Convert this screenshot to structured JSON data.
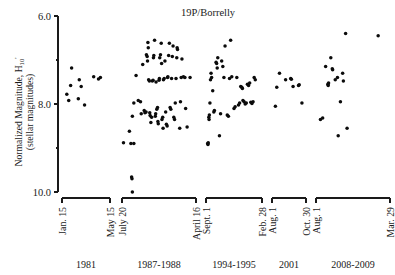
{
  "chart_data": {
    "type": "scatter",
    "title": "19P/Borrelly",
    "xlabel": "",
    "ylabel": "Normalized Magnitude, H10' (stellar magnitudes)",
    "ylabel_parts": {
      "line1_pre": "Normalized Magnitude, H",
      "line1_sub": "10",
      "line1_sup": "'",
      "line2": "(stellar magnitudes)"
    },
    "y_axis": {
      "inverted": true,
      "min": 6.0,
      "max": 10.0,
      "major_ticks": [
        6.0,
        8.0,
        10.0
      ],
      "major_tick_labels": [
        "6.0",
        "8.0",
        "10.0"
      ],
      "minor_ticks": [
        7.0,
        9.0
      ],
      "grid": false
    },
    "legend": "none",
    "groups": [
      {
        "name": "1981",
        "start_label": "Jan. 15",
        "end_label": "May 15",
        "points": [
          {
            "t": 0.1,
            "m": 7.78
          },
          {
            "t": 0.2,
            "m": 7.18
          },
          {
            "t": 0.18,
            "m": 7.58
          },
          {
            "t": 0.14,
            "m": 7.92
          },
          {
            "t": 0.36,
            "m": 7.45
          },
          {
            "t": 0.4,
            "m": 7.6
          },
          {
            "t": 0.34,
            "m": 7.88
          },
          {
            "t": 0.47,
            "m": 8.02
          },
          {
            "t": 0.66,
            "m": 7.38
          },
          {
            "t": 0.76,
            "m": 7.43
          },
          {
            "t": 0.8,
            "m": 7.4
          }
        ]
      },
      {
        "name": "1987-1988",
        "start_label": "July 20",
        "end_label": "April 16",
        "points": [
          {
            "t": 0.02,
            "m": 8.88
          },
          {
            "t": 0.1,
            "m": 8.62
          },
          {
            "t": 0.12,
            "m": 8.9
          },
          {
            "t": 0.16,
            "m": 8.9
          },
          {
            "t": 0.13,
            "m": 9.66
          },
          {
            "t": 0.135,
            "m": 9.7
          },
          {
            "t": 0.14,
            "m": 10.0
          },
          {
            "t": 0.14,
            "m": 8.28
          },
          {
            "t": 0.16,
            "m": 7.98
          },
          {
            "t": 0.19,
            "m": 7.35
          },
          {
            "t": 0.22,
            "m": 7.92
          },
          {
            "t": 0.25,
            "m": 7.95
          },
          {
            "t": 0.26,
            "m": 8.22
          },
          {
            "t": 0.28,
            "m": 7.1
          },
          {
            "t": 0.3,
            "m": 8.15
          },
          {
            "t": 0.31,
            "m": 8.2
          },
          {
            "t": 0.325,
            "m": 8.18
          },
          {
            "t": 0.33,
            "m": 6.88
          },
          {
            "t": 0.34,
            "m": 6.92
          },
          {
            "t": 0.345,
            "m": 7.02
          },
          {
            "t": 0.35,
            "m": 6.6
          },
          {
            "t": 0.355,
            "m": 6.72
          },
          {
            "t": 0.36,
            "m": 7.45
          },
          {
            "t": 0.37,
            "m": 7.48
          },
          {
            "t": 0.375,
            "m": 8.2
          },
          {
            "t": 0.38,
            "m": 8.26
          },
          {
            "t": 0.39,
            "m": 8.42
          },
          {
            "t": 0.4,
            "m": 8.3
          },
          {
            "t": 0.41,
            "m": 7.48
          },
          {
            "t": 0.42,
            "m": 7.46
          },
          {
            "t": 0.425,
            "m": 6.95
          },
          {
            "t": 0.43,
            "m": 6.9
          },
          {
            "t": 0.44,
            "m": 6.55
          },
          {
            "t": 0.45,
            "m": 8.28
          },
          {
            "t": 0.455,
            "m": 8.22
          },
          {
            "t": 0.46,
            "m": 7.5
          },
          {
            "t": 0.47,
            "m": 8.12
          },
          {
            "t": 0.48,
            "m": 8.08
          },
          {
            "t": 0.485,
            "m": 8.4
          },
          {
            "t": 0.49,
            "m": 8.45
          },
          {
            "t": 0.5,
            "m": 7.46
          },
          {
            "t": 0.505,
            "m": 7.42
          },
          {
            "t": 0.51,
            "m": 6.95
          },
          {
            "t": 0.52,
            "m": 6.88
          },
          {
            "t": 0.53,
            "m": 6.62
          },
          {
            "t": 0.535,
            "m": 7.08
          },
          {
            "t": 0.54,
            "m": 8.35
          },
          {
            "t": 0.55,
            "m": 8.3
          },
          {
            "t": 0.555,
            "m": 8.55
          },
          {
            "t": 0.56,
            "m": 7.45
          },
          {
            "t": 0.57,
            "m": 7.42
          },
          {
            "t": 0.58,
            "m": 7.02
          },
          {
            "t": 0.59,
            "m": 8.18
          },
          {
            "t": 0.6,
            "m": 8.46
          },
          {
            "t": 0.61,
            "m": 8.5
          },
          {
            "t": 0.615,
            "m": 7.4
          },
          {
            "t": 0.62,
            "m": 7.38
          },
          {
            "t": 0.63,
            "m": 6.9
          },
          {
            "t": 0.64,
            "m": 6.62
          },
          {
            "t": 0.65,
            "m": 8.08
          },
          {
            "t": 0.66,
            "m": 8.12
          },
          {
            "t": 0.67,
            "m": 7.42
          },
          {
            "t": 0.68,
            "m": 6.92
          },
          {
            "t": 0.69,
            "m": 6.68
          },
          {
            "t": 0.7,
            "m": 8.3
          },
          {
            "t": 0.71,
            "m": 8.35
          },
          {
            "t": 0.72,
            "m": 7.98
          },
          {
            "t": 0.73,
            "m": 7.42
          },
          {
            "t": 0.74,
            "m": 6.95
          },
          {
            "t": 0.745,
            "m": 6.72
          },
          {
            "t": 0.75,
            "m": 6.76
          },
          {
            "t": 0.78,
            "m": 8.55
          },
          {
            "t": 0.79,
            "m": 7.95
          },
          {
            "t": 0.8,
            "m": 7.4
          },
          {
            "t": 0.81,
            "m": 6.98
          },
          {
            "t": 0.83,
            "m": 7.38
          },
          {
            "t": 0.85,
            "m": 7.4
          },
          {
            "t": 0.86,
            "m": 8.1
          },
          {
            "t": 0.88,
            "m": 8.52
          },
          {
            "t": 0.92,
            "m": 7.4
          }
        ]
      },
      {
        "name": "1994-1995",
        "start_label": "Sept. 1",
        "end_label": "Feb. 28",
        "points": [
          {
            "t": 0.03,
            "m": 8.9
          },
          {
            "t": 0.035,
            "m": 8.92
          },
          {
            "t": 0.04,
            "m": 8.88
          },
          {
            "t": 0.05,
            "m": 8.3
          },
          {
            "t": 0.055,
            "m": 8.35
          },
          {
            "t": 0.06,
            "m": 8.25
          },
          {
            "t": 0.07,
            "m": 7.98
          },
          {
            "t": 0.08,
            "m": 7.45
          },
          {
            "t": 0.09,
            "m": 7.3
          },
          {
            "t": 0.1,
            "m": 7.4
          },
          {
            "t": 0.12,
            "m": 7.7
          },
          {
            "t": 0.14,
            "m": 8.18
          },
          {
            "t": 0.15,
            "m": 8.15
          },
          {
            "t": 0.18,
            "m": 7.05
          },
          {
            "t": 0.19,
            "m": 7.08
          },
          {
            "t": 0.2,
            "m": 7.18
          },
          {
            "t": 0.21,
            "m": 6.95
          },
          {
            "t": 0.24,
            "m": 8.72
          },
          {
            "t": 0.26,
            "m": 8.22
          },
          {
            "t": 0.28,
            "m": 7.02
          },
          {
            "t": 0.3,
            "m": 7.15
          },
          {
            "t": 0.32,
            "m": 7.4
          },
          {
            "t": 0.34,
            "m": 6.68
          },
          {
            "t": 0.38,
            "m": 8.25
          },
          {
            "t": 0.4,
            "m": 8.28
          },
          {
            "t": 0.42,
            "m": 7.42
          },
          {
            "t": 0.44,
            "m": 6.55
          },
          {
            "t": 0.46,
            "m": 7.38
          },
          {
            "t": 0.5,
            "m": 8.1
          },
          {
            "t": 0.52,
            "m": 8.06
          },
          {
            "t": 0.55,
            "m": 7.4
          },
          {
            "t": 0.58,
            "m": 8.02
          },
          {
            "t": 0.6,
            "m": 7.98
          },
          {
            "t": 0.62,
            "m": 7.6
          },
          {
            "t": 0.64,
            "m": 7.62
          },
          {
            "t": 0.65,
            "m": 7.65
          },
          {
            "t": 0.66,
            "m": 7.92
          },
          {
            "t": 0.68,
            "m": 7.95
          },
          {
            "t": 0.7,
            "m": 8.0
          },
          {
            "t": 0.72,
            "m": 7.98
          },
          {
            "t": 0.74,
            "m": 7.55
          },
          {
            "t": 0.76,
            "m": 7.58
          },
          {
            "t": 0.78,
            "m": 7.52
          },
          {
            "t": 0.8,
            "m": 7.96
          },
          {
            "t": 0.82,
            "m": 7.99
          },
          {
            "t": 0.84,
            "m": 7.95
          },
          {
            "t": 0.86,
            "m": 7.4
          },
          {
            "t": 0.88,
            "m": 7.45
          }
        ]
      },
      {
        "name": "2001",
        "start_label": "Aug. 1",
        "end_label": "Oct. 30",
        "points": [
          {
            "t": 0.1,
            "m": 8.05
          },
          {
            "t": 0.14,
            "m": 7.62
          },
          {
            "t": 0.22,
            "m": 7.3
          },
          {
            "t": 0.4,
            "m": 7.45
          },
          {
            "t": 0.55,
            "m": 7.42
          },
          {
            "t": 0.57,
            "m": 7.44
          },
          {
            "t": 0.62,
            "m": 7.6
          },
          {
            "t": 0.78,
            "m": 7.58
          },
          {
            "t": 0.8,
            "m": 7.56
          },
          {
            "t": 0.88,
            "m": 7.98
          }
        ]
      },
      {
        "name": "2008-2009",
        "start_label": "Aug. 1",
        "end_label": "Mar. 29",
        "points": [
          {
            "t": 0.06,
            "m": 8.35
          },
          {
            "t": 0.09,
            "m": 8.32
          },
          {
            "t": 0.13,
            "m": 7.15
          },
          {
            "t": 0.16,
            "m": 7.55
          },
          {
            "t": 0.165,
            "m": 7.58
          },
          {
            "t": 0.17,
            "m": 7.52
          },
          {
            "t": 0.2,
            "m": 6.95
          },
          {
            "t": 0.22,
            "m": 7.2
          },
          {
            "t": 0.225,
            "m": 7.22
          },
          {
            "t": 0.26,
            "m": 7.45
          },
          {
            "t": 0.29,
            "m": 7.4
          },
          {
            "t": 0.3,
            "m": 8.72
          },
          {
            "t": 0.33,
            "m": 7.95
          },
          {
            "t": 0.36,
            "m": 7.3
          },
          {
            "t": 0.37,
            "m": 7.48
          },
          {
            "t": 0.4,
            "m": 6.4
          },
          {
            "t": 0.42,
            "m": 8.55
          },
          {
            "t": 0.84,
            "m": 6.45
          }
        ]
      }
    ]
  }
}
